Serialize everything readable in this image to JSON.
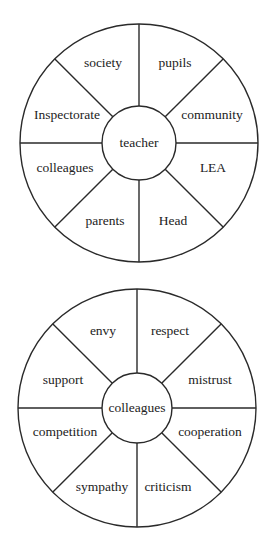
{
  "diagrams": [
    {
      "name": "teacher-wheel",
      "center": {
        "x": 139,
        "y": 143
      },
      "outer_radius": 119,
      "inner_radius": 37,
      "hub_label": "teacher",
      "segments": [
        {
          "label": "society",
          "x": 103,
          "y": 63
        },
        {
          "label": "pupils",
          "x": 175,
          "y": 63
        },
        {
          "label": "community",
          "x": 212,
          "y": 115
        },
        {
          "label": "LEA",
          "x": 213,
          "y": 168
        },
        {
          "label": "Head",
          "x": 173,
          "y": 221
        },
        {
          "label": "parents",
          "x": 105,
          "y": 221
        },
        {
          "label": "colleagues",
          "x": 65,
          "y": 168
        },
        {
          "label": "Inspectorate",
          "x": 67,
          "y": 115
        }
      ]
    },
    {
      "name": "colleagues-wheel",
      "center": {
        "x": 137,
        "y": 408
      },
      "outer_radius": 119,
      "inner_radius": 35,
      "hub_label": "colleagues",
      "segments": [
        {
          "label": "envy",
          "x": 103,
          "y": 331
        },
        {
          "label": "respect",
          "x": 170,
          "y": 331
        },
        {
          "label": "mistrust",
          "x": 210,
          "y": 380
        },
        {
          "label": "cooperation",
          "x": 210,
          "y": 432
        },
        {
          "label": "criticism",
          "x": 168,
          "y": 487
        },
        {
          "label": "sympathy",
          "x": 102,
          "y": 487
        },
        {
          "label": "competition",
          "x": 65,
          "y": 432
        },
        {
          "label": "support",
          "x": 63,
          "y": 380
        }
      ]
    }
  ],
  "colors": {
    "line": "#2a2a2a",
    "text": "#222222",
    "background": "#ffffff"
  }
}
